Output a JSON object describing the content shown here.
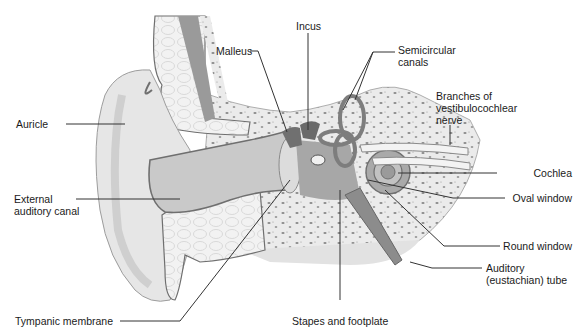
{
  "figure": {
    "colors": {
      "skin": "#e6e6e6",
      "skin_shade": "#cfcfcf",
      "canal": "#c9c9c9",
      "tissue_outline": "#6f6f6f",
      "bone": "#ebebeb",
      "bone_speckle": "#8a8a8a",
      "cartilage": "#f2f2f2",
      "dark_structure": "#8c8c8c",
      "leader_line": "#333333",
      "text": "#1a1a1a"
    },
    "labels": [
      {
        "id": "malleus",
        "text": "Malleus"
      },
      {
        "id": "incus",
        "text": "Incus"
      },
      {
        "id": "semicircular-canals",
        "text": "Semicircular\ncanals"
      },
      {
        "id": "branches-vestibulocochlear",
        "text": "Branches of\nvestibulocochlear\nnerve"
      },
      {
        "id": "auricle",
        "text": "Auricle"
      },
      {
        "id": "cochlea",
        "text": "Cochlea"
      },
      {
        "id": "external-auditory-canal",
        "text": "External\nauditory canal"
      },
      {
        "id": "oval-window",
        "text": "Oval window"
      },
      {
        "id": "round-window",
        "text": "Round window"
      },
      {
        "id": "auditory-tube",
        "text": "Auditory\n(eustachian) tube"
      },
      {
        "id": "tympanic-membrane",
        "text": "Tympanic membrane"
      },
      {
        "id": "stapes-footplate",
        "text": "Stapes and footplate"
      }
    ]
  }
}
